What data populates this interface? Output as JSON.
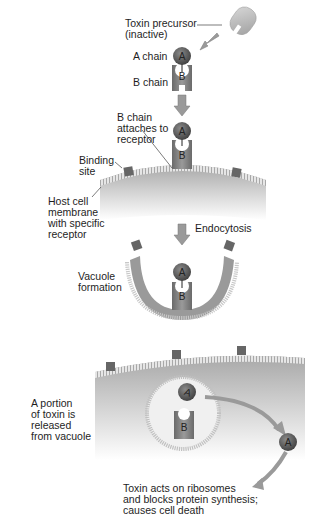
{
  "diagram": {
    "steps": [
      {
        "id": "precursor",
        "label": "Toxin precursor\n(inactive)"
      },
      {
        "id": "a_chain",
        "label": "A chain"
      },
      {
        "id": "b_chain",
        "label": "B chain"
      },
      {
        "id": "attach",
        "label": "B chain\nattaches to\nreceptor"
      },
      {
        "id": "binding_site",
        "label": "Binding\nsite"
      },
      {
        "id": "membrane",
        "label": "Host cell\nmembrane\nwith specific\nreceptor"
      },
      {
        "id": "endocytosis",
        "label": "Endocytosis"
      },
      {
        "id": "vacuole",
        "label": "Vacuole\nformation"
      },
      {
        "id": "release",
        "label": "A portion\nof toxin is\nreleased\nfrom vacuole"
      },
      {
        "id": "effect",
        "label": "Toxin acts on ribosomes\nand blocks protein synthesis;\ncauses cell death"
      }
    ],
    "glyphs": {
      "a": "A",
      "b": "B"
    },
    "colors": {
      "a_chain": "#5a5a5a",
      "b_chain": "#7c7c7c",
      "cell": "#b4b4b4",
      "arrow": "#9a9a9a",
      "receptor": "#6a6a6a",
      "membrane": "#d0d0d0"
    }
  }
}
